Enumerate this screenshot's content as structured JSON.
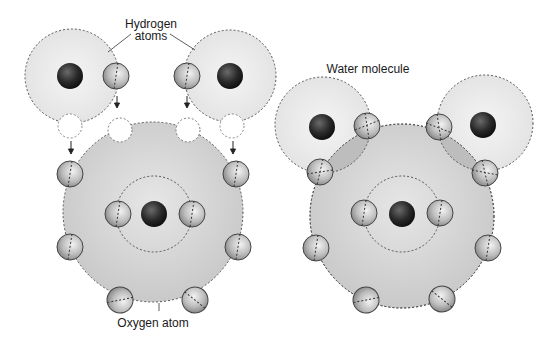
{
  "labels": {
    "hydrogen_line1": "Hydrogen",
    "hydrogen_line2": "atoms",
    "water_molecule": "Water molecule",
    "oxygen_atom": "Oxygen atom"
  },
  "colors": {
    "background": "#ffffff",
    "hydrogen_shell": "#ececec",
    "oxygen_shell": "#d6d6d6",
    "overlap_shell": "#c4c4c4",
    "nucleus": "#2a2a2a",
    "electron": "#bdbdbd",
    "dashed_line": "#555555"
  },
  "left_panel": {
    "hydrogen_atoms": [
      {
        "shell": [
          72,
          76,
          47
        ],
        "nucleus": [
          70,
          76
        ],
        "electron": [
          116,
          76
        ],
        "vacancy": [
          70,
          126
        ],
        "target_vacancy": [
          120,
          130
        ]
      },
      {
        "shell": [
          230,
          76,
          46
        ],
        "nucleus": [
          230,
          76
        ],
        "electron": [
          187,
          76
        ],
        "vacancy": [
          232,
          126
        ],
        "target_vacancy": [
          188,
          130
        ]
      }
    ],
    "oxygen_atom": {
      "shell": [
        153,
        212,
        90
      ],
      "inner_ring": [
        154,
        214,
        38
      ],
      "nucleus": [
        154,
        214
      ],
      "inner_electrons": [
        [
          118,
          214
        ],
        [
          192,
          214
        ]
      ],
      "outer_electrons": [
        [
          70,
          174
        ],
        [
          236,
          174
        ],
        [
          70,
          247
        ],
        [
          238,
          247
        ],
        [
          120,
          300
        ],
        [
          195,
          300
        ]
      ]
    }
  },
  "right_panel": {
    "hydrogen_atoms": [
      {
        "shell": [
          323,
          125,
          48
        ],
        "nucleus": [
          322,
          127
        ],
        "shared_electrons": [
          [
            367,
            126
          ],
          [
            320,
            172
          ]
        ]
      },
      {
        "shell": [
          485,
          123,
          48
        ],
        "nucleus": [
          483,
          125
        ],
        "shared_electrons": [
          [
            439,
            127
          ],
          [
            485,
            173
          ]
        ]
      }
    ],
    "oxygen_atom": {
      "shell": [
        402,
        216,
        92
      ],
      "inner_ring": [
        402,
        214,
        38
      ],
      "nucleus": [
        402,
        214
      ],
      "inner_electrons": [
        [
          364,
          213
        ],
        [
          440,
          213
        ]
      ],
      "outer_electrons": [
        [
          316,
          248
        ],
        [
          488,
          248
        ],
        [
          366,
          300
        ],
        [
          442,
          299
        ]
      ]
    }
  }
}
